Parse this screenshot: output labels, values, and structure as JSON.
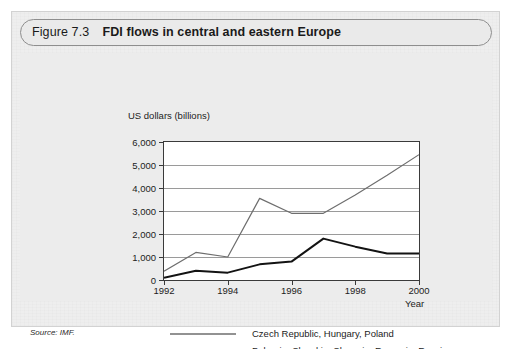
{
  "figure": {
    "number": "Figure 7.3",
    "title": "FDI flows in central and eastern Europe",
    "source": "Source: IMF."
  },
  "chart_data": {
    "type": "line",
    "title": "FDI flows in central and eastern Europe",
    "xlabel": "Year",
    "ylabel": "US dollars (billions)",
    "x": [
      1992,
      1993,
      1994,
      1995,
      1996,
      1997,
      1998,
      1999,
      2000
    ],
    "xlim": [
      1992,
      2000
    ],
    "ylim": [
      0,
      6000
    ],
    "ytick_labels": [
      "6,000",
      "5,000",
      "4,000",
      "3,000",
      "2,000",
      "1,000",
      "0"
    ],
    "ytick_values": [
      6000,
      5000,
      4000,
      3000,
      2000,
      1000,
      0
    ],
    "xtick_labels": [
      "1992",
      "1994",
      "1996",
      "1998",
      "2000"
    ],
    "xtick_values": [
      1992,
      1994,
      1996,
      1998,
      2000
    ],
    "grid": true,
    "legend_position": "below",
    "series": [
      {
        "name": "Czech Republic, Hungary, Poland",
        "color": "#6e6e6e",
        "width": 1.2,
        "values": [
          380,
          1200,
          1000,
          3550,
          2900,
          2900,
          3700,
          4550,
          5450
        ]
      },
      {
        "name": "Bulgaria, Slovakia, Slovenia, Romania, Russia",
        "color": "#131313",
        "width": 2.0,
        "values": [
          100,
          400,
          320,
          680,
          800,
          1800,
          1450,
          1150,
          1150
        ]
      }
    ]
  }
}
